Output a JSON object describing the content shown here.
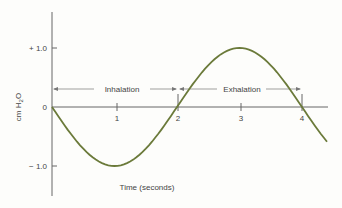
{
  "chart_data": {
    "type": "line",
    "title": "",
    "xlabel": "Time (seconds)",
    "ylabel": "cm H2O",
    "ylabel_main": "cm H",
    "ylabel_sub": "2",
    "ylabel_tail": "O",
    "x_ticks": [
      "1",
      "2",
      "3",
      "4"
    ],
    "y_ticks": [
      "+ 1.0",
      "0",
      "− 1.0"
    ],
    "xlim": [
      0,
      4.4
    ],
    "ylim": [
      -1.6,
      1.6
    ],
    "grid": false,
    "series": [
      {
        "name": "Intrapleural/alveolar pressure",
        "color": "#6b7a3a",
        "x": [
          0,
          0.5,
          1,
          1.5,
          2,
          2.5,
          3,
          3.5,
          4,
          4.4
        ],
        "y": [
          0,
          -0.71,
          -1.0,
          -0.71,
          0,
          0.71,
          1.0,
          0.71,
          0,
          -0.59
        ]
      }
    ],
    "annotations": [
      {
        "label": "Inhalation",
        "from": 0,
        "to": 2
      },
      {
        "label": "Exhalation",
        "from": 2,
        "to": 4
      }
    ]
  }
}
